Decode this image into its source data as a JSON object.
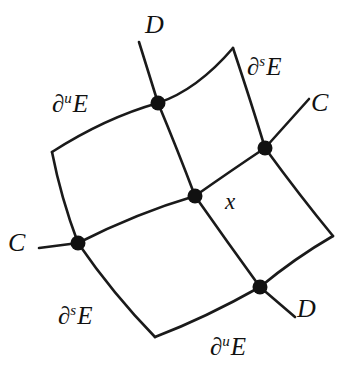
{
  "figure": {
    "background_color": "#ffffff",
    "stroke_color": "#1a1a1a",
    "node_color": "#111111",
    "curve_width": 2.6,
    "node_radius": 7.5,
    "width": 353,
    "height": 372
  },
  "labels": {
    "d_top": "D",
    "ds_top_right": {
      "partial": "∂",
      "sup": "s",
      "set": "E"
    },
    "du_top_left": {
      "partial": "∂",
      "sup": "u",
      "set": "E"
    },
    "c_right": "C",
    "c_left": "C",
    "ds_bottom_left": {
      "partial": "∂",
      "sup": "s",
      "set": "E"
    },
    "du_bottom": {
      "partial": "∂",
      "sup": "u",
      "set": "E"
    },
    "d_bottom_right": "D",
    "x_point": "x"
  },
  "nodes": [
    {
      "name": "node-top",
      "x": 158,
      "y": 103
    },
    {
      "name": "node-top-right",
      "x": 265,
      "y": 148
    },
    {
      "name": "node-center",
      "x": 195,
      "y": 196
    },
    {
      "name": "node-left",
      "x": 78,
      "y": 243
    },
    {
      "name": "node-bottom-right",
      "x": 260,
      "y": 287
    }
  ],
  "corners": [
    {
      "name": "corner-top",
      "x": 233,
      "y": 48
    },
    {
      "name": "corner-right",
      "x": 333,
      "y": 236
    },
    {
      "name": "corner-bottom",
      "x": 155,
      "y": 337
    },
    {
      "name": "corner-left",
      "x": 52,
      "y": 152
    }
  ],
  "extensions": [
    {
      "name": "extension-d-top",
      "label": "D",
      "from_node": "node-top",
      "to_x": 139,
      "to_y": 42
    },
    {
      "name": "extension-c-right",
      "label": "C",
      "from_node": "node-top-right",
      "to_x": 309,
      "to_y": 99
    },
    {
      "name": "extension-c-left",
      "label": "C",
      "from_node": "node-left",
      "to_x": 39,
      "to_y": 248
    },
    {
      "name": "extension-d-bottom-right",
      "label": "D",
      "from_node": "node-bottom-right",
      "to_x": 295,
      "to_y": 317
    }
  ],
  "label_positions": {
    "d_top": {
      "x": 145,
      "y": 12
    },
    "ds_top_right": {
      "x": 247,
      "y": 54
    },
    "du_top_left": {
      "x": 52,
      "y": 91
    },
    "c_right": {
      "x": 311,
      "y": 90
    },
    "c_left": {
      "x": 8,
      "y": 230
    },
    "ds_bottom_left": {
      "x": 58,
      "y": 303
    },
    "du_bottom": {
      "x": 210,
      "y": 334
    },
    "d_bottom_right": {
      "x": 297,
      "y": 296
    },
    "x_point": {
      "x": 225,
      "y": 190
    }
  }
}
